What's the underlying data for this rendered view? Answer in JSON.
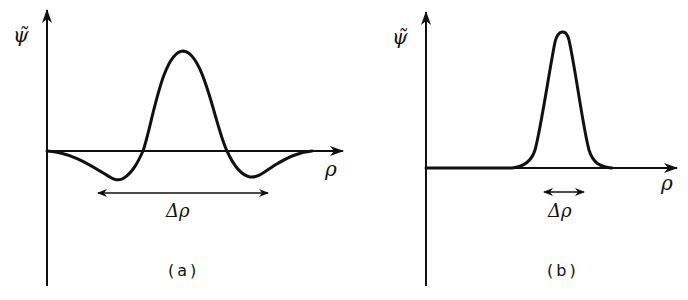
{
  "figure": {
    "panels": [
      {
        "id": "a",
        "caption": "(a)",
        "y_axis_label": "ψ̃",
        "x_axis_label": "ρ",
        "width_label": "Δρ",
        "description": "Wide wavepacket in momentum space: central positive peak flanked by two negative side lobes; large spread Δρ"
      },
      {
        "id": "b",
        "caption": "(b)",
        "y_axis_label": "ψ̃",
        "x_axis_label": "ρ",
        "width_label": "Δρ",
        "description": "Narrow single positive peak; small spread Δρ"
      }
    ]
  }
}
